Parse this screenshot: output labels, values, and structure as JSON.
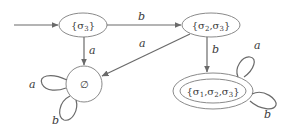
{
  "diagram": {
    "type": "finite-automaton",
    "nodes": [
      {
        "id": "s3",
        "label": "{σ3}",
        "label_parts": [
          "{σ",
          "3",
          "}"
        ],
        "initial": true,
        "accepting": false
      },
      {
        "id": "s23",
        "label": "{σ2,σ3}",
        "label_parts": [
          "{σ",
          "2",
          ",σ",
          "3",
          "}"
        ],
        "initial": false,
        "accepting": false
      },
      {
        "id": "empty",
        "label": "∅",
        "initial": false,
        "accepting": false
      },
      {
        "id": "s123",
        "label": "{σ1,σ2,σ3}",
        "label_parts": [
          "{σ",
          "1",
          ",σ",
          "2",
          ",σ",
          "3",
          "}"
        ],
        "initial": false,
        "accepting": true
      }
    ],
    "edges": [
      {
        "from": "s3",
        "to": "s23",
        "label": "b"
      },
      {
        "from": "s3",
        "to": "empty",
        "label": "a"
      },
      {
        "from": "s23",
        "to": "empty",
        "label": "a"
      },
      {
        "from": "s23",
        "to": "s123",
        "label": "b"
      },
      {
        "from": "empty",
        "to": "empty",
        "label": "a"
      },
      {
        "from": "empty",
        "to": "empty",
        "label": "b"
      },
      {
        "from": "s123",
        "to": "s123",
        "label": "a"
      },
      {
        "from": "s123",
        "to": "s123",
        "label": "b"
      }
    ]
  }
}
